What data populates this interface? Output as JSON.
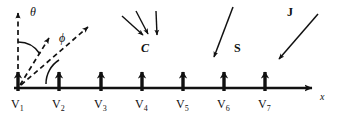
{
  "figure": {
    "background": "#ffffff",
    "ink": "#111111",
    "width": 338,
    "height": 123
  },
  "axis": {
    "label": "x",
    "y": 88,
    "x_start": 14,
    "x_end": 320,
    "arrowhead": "right"
  },
  "sites": [
    {
      "label": "V",
      "sub": "1",
      "x": 18
    },
    {
      "label": "V",
      "sub": "2",
      "x": 59
    },
    {
      "label": "V",
      "sub": "3",
      "x": 101
    },
    {
      "label": "V",
      "sub": "4",
      "x": 142
    },
    {
      "label": "V",
      "sub": "5",
      "x": 183
    },
    {
      "label": "V",
      "sub": "6",
      "x": 224
    },
    {
      "label": "V",
      "sub": "7",
      "x": 265
    }
  ],
  "angles": [
    {
      "name": "theta",
      "symbol": "θ",
      "x": 34,
      "y": 12,
      "measured_from": "vertical-axis"
    },
    {
      "name": "phi",
      "symbol": "ϕ",
      "x": 62,
      "y": 34,
      "measured_from": "x-axis"
    }
  ],
  "vectors": [
    {
      "name": "vertical-reference",
      "style": "dashed",
      "from": [
        18,
        88
      ],
      "to": [
        18,
        8
      ],
      "arrow": true
    },
    {
      "name": "theta-vector",
      "style": "dashed",
      "from": [
        18,
        88
      ],
      "to": [
        50,
        36
      ],
      "arrow": true
    },
    {
      "name": "phi-vector",
      "style": "dashed",
      "from": [
        18,
        88
      ],
      "to": [
        90,
        25
      ],
      "arrow": true
    }
  ],
  "incident": [
    {
      "name": "C",
      "label": "C",
      "label_x": 146,
      "label_y": 48,
      "style": "italic-bold",
      "rays": 3
    },
    {
      "name": "S",
      "label": "S",
      "label_x": 238,
      "label_y": 48,
      "style": "bold",
      "rays": 1
    },
    {
      "name": "J",
      "label": "J",
      "label_x": 290,
      "label_y": 12,
      "style": "bold",
      "rays": 1
    }
  ],
  "rays": {
    "C": [
      {
        "from": [
          122,
          16
        ],
        "to": [
          144,
          36
        ]
      },
      {
        "from": [
          136,
          12
        ],
        "to": [
          148,
          35
        ]
      },
      {
        "from": [
          155,
          12
        ],
        "to": [
          156,
          36
        ]
      }
    ],
    "S": [
      {
        "from": [
          232,
          8
        ],
        "to": [
          213,
          58
        ]
      }
    ],
    "J": [
      {
        "from": [
          317,
          14
        ],
        "to": [
          278,
          60
        ]
      }
    ]
  }
}
